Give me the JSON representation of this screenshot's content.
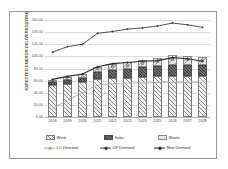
{
  "chart_data": {
    "type": "bar",
    "title": "",
    "xlabel": "",
    "ylabel": "EXPECTED ENERGY DELIVERED(GWH)",
    "categories": [
      "2018",
      "2019",
      "2020",
      "2021",
      "2022",
      "2023",
      "2024",
      "2025",
      "2026",
      "2027",
      "2028"
    ],
    "ylim": [
      0,
      160
    ],
    "yticks": [
      {
        "value": 160,
        "label": "160,00"
      },
      {
        "value": 140,
        "label": "140,00"
      },
      {
        "value": 120,
        "label": "120,00"
      },
      {
        "value": 100,
        "label": "100,00"
      },
      {
        "value": 80,
        "label": "80,00"
      },
      {
        "value": 60,
        "label": "60,00"
      },
      {
        "value": 40,
        "label": "40,00"
      },
      {
        "value": 20,
        "label": "20,00"
      },
      {
        "value": 0,
        "label": "0,00"
      }
    ],
    "grid": true,
    "legend_position": "bottom",
    "stacked": true,
    "series": [
      {
        "name": "Wind",
        "kind": "bar",
        "values": [
          52,
          55,
          58,
          62,
          64,
          65,
          66,
          67,
          68,
          68,
          68
        ]
      },
      {
        "name": "Solar",
        "kind": "bar",
        "values": [
          5,
          6,
          7,
          12,
          13,
          14,
          16,
          17,
          18,
          18,
          18
        ]
      },
      {
        "name": "Waste",
        "kind": "bar",
        "values": [
          4,
          5,
          6,
          9,
          10,
          11,
          12,
          13,
          16,
          15,
          13
        ]
      },
      {
        "name": "LO Demand",
        "kind": "line",
        "values": [
          14,
          28,
          40,
          53,
          55,
          56,
          56,
          57,
          57,
          57,
          57
        ]
      },
      {
        "name": "UP Demand",
        "kind": "line",
        "values": [
          107,
          116,
          120,
          138,
          141,
          145,
          147,
          150,
          155,
          152,
          148
        ]
      },
      {
        "name": "Med Demand",
        "kind": "line",
        "values": [
          62,
          67,
          71,
          83,
          88,
          90,
          92,
          93,
          98,
          96,
          92
        ]
      }
    ],
    "bar_labels": [
      [
        "62",
        "67",
        "71",
        "83",
        "88",
        "90",
        "92",
        "93",
        "98",
        "96",
        "92"
      ]
    ],
    "colors": {
      "wind": "#8e8e8e",
      "solar": "#4a4a4a",
      "waste": "#a0a0a0",
      "lo_demand": "#b0b0b0",
      "up_demand": "#404040",
      "med_demand": "#2b2b2b",
      "grid": "#dcdcdc",
      "frame": "#9a9a9a"
    }
  },
  "legend": {
    "items": [
      {
        "label": "Wind",
        "style": "wind"
      },
      {
        "label": "Solar",
        "style": "solar"
      },
      {
        "label": "Waste",
        "style": "waste"
      },
      {
        "label": "LO Demand",
        "style": "lo"
      },
      {
        "label": "UP Demand",
        "style": "up"
      },
      {
        "label": "Med Demand",
        "style": "med"
      }
    ]
  }
}
